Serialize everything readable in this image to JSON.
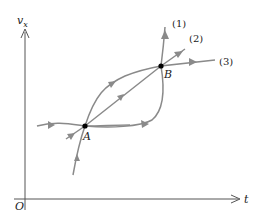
{
  "diagram": {
    "axes": {
      "y_label": "v",
      "y_label_sub": "x",
      "x_label": "t",
      "origin_label": "O"
    },
    "points": [
      {
        "id": "A",
        "label": "A"
      },
      {
        "id": "B",
        "label": "B"
      }
    ],
    "curve_labels": [
      "(1)",
      "(2)",
      "(3)"
    ],
    "colors": {
      "curve": "#8a8a8a",
      "axis": "#555555",
      "point": "#000000"
    }
  }
}
